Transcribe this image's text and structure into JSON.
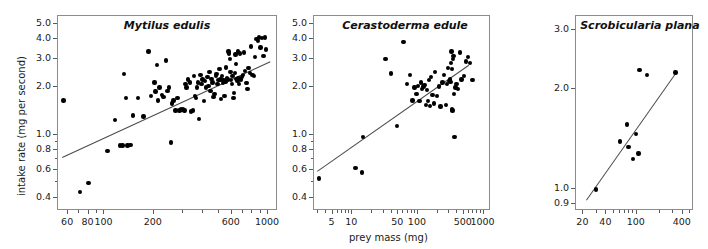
{
  "figure": {
    "y_axis_label": "intake rate (mg per second)",
    "x_axis_label": "prey mass (mg)",
    "scale": "log-log",
    "marker_color": "#000000",
    "line_color": "#4a4a4a",
    "frame_color": "#8c8c8c"
  },
  "chart_data": [
    {
      "type": "scatter",
      "title": "Mytilus edulis",
      "xlabel": "prey mass (mg)",
      "ylabel": "intake rate (mg per second)",
      "xscale": "log",
      "yscale": "log",
      "xlim": [
        52,
        1150
      ],
      "ylim": [
        0.33,
        5.6
      ],
      "xticks": [
        60,
        80,
        100,
        200,
        600,
        1000
      ],
      "xtick_labels": [
        "60",
        "80",
        "100",
        "200",
        "600",
        "1000"
      ],
      "yticks": [
        0.4,
        0.6,
        0.8,
        1.0,
        2.0,
        3.0,
        4.0,
        5.0
      ],
      "ytick_labels": [
        "0.4",
        "0.6",
        "0.8",
        "1.0",
        "2.0",
        "3.0",
        "4.0",
        "5.0"
      ],
      "grid": false,
      "legend": "none",
      "fit_line": {
        "x": [
          56,
          1050
        ],
        "y": [
          0.71,
          2.85
        ]
      },
      "points": [
        [
          57,
          1.62
        ],
        [
          72,
          0.43
        ],
        [
          81,
          0.49
        ],
        [
          106,
          0.78
        ],
        [
          118,
          1.22
        ],
        [
          126,
          0.84
        ],
        [
          131,
          0.84
        ],
        [
          134,
          2.38
        ],
        [
          137,
          1.68
        ],
        [
          140,
          0.84
        ],
        [
          146,
          0.85
        ],
        [
          152,
          1.3
        ],
        [
          163,
          1.68
        ],
        [
          176,
          1.28
        ],
        [
          188,
          3.3
        ],
        [
          196,
          1.73
        ],
        [
          205,
          2.1
        ],
        [
          208,
          1.84
        ],
        [
          212,
          2.7
        ],
        [
          216,
          1.62
        ],
        [
          220,
          1.95
        ],
        [
          228,
          1.75
        ],
        [
          233,
          1.7
        ],
        [
          241,
          2.9
        ],
        [
          246,
          1.85
        ],
        [
          252,
          1.95
        ],
        [
          258,
          0.88
        ],
        [
          263,
          1.55
        ],
        [
          268,
          1.62
        ],
        [
          276,
          1.4
        ],
        [
          284,
          1.68
        ],
        [
          292,
          1.4
        ],
        [
          298,
          1.42
        ],
        [
          305,
          1.42
        ],
        [
          312,
          1.4
        ],
        [
          318,
          2.05
        ],
        [
          322,
          1.95
        ],
        [
          330,
          2.2
        ],
        [
          337,
          2.1
        ],
        [
          344,
          1.38
        ],
        [
          352,
          1.4
        ],
        [
          358,
          2.3
        ],
        [
          362,
          1.72
        ],
        [
          368,
          1.68
        ],
        [
          372,
          1.95
        ],
        [
          378,
          2.1
        ],
        [
          385,
          1.24
        ],
        [
          392,
          2.35
        ],
        [
          398,
          2.05
        ],
        [
          404,
          2.2
        ],
        [
          412,
          1.6
        ],
        [
          418,
          2.15
        ],
        [
          424,
          1.95
        ],
        [
          432,
          2.28
        ],
        [
          438,
          2.0
        ],
        [
          444,
          2.45
        ],
        [
          452,
          1.85
        ],
        [
          458,
          2.22
        ],
        [
          464,
          2.1
        ],
        [
          470,
          1.7
        ],
        [
          478,
          1.78
        ],
        [
          486,
          2.3
        ],
        [
          492,
          2.38
        ],
        [
          498,
          2.05
        ],
        [
          504,
          2.18
        ],
        [
          512,
          2.55
        ],
        [
          518,
          2.2
        ],
        [
          524,
          1.65
        ],
        [
          530,
          2.3
        ],
        [
          536,
          2.08
        ],
        [
          542,
          2.18
        ],
        [
          548,
          1.72
        ],
        [
          556,
          2.12
        ],
        [
          562,
          2.62
        ],
        [
          568,
          2.25
        ],
        [
          574,
          2.2
        ],
        [
          580,
          3.3
        ],
        [
          586,
          3.2
        ],
        [
          592,
          2.95
        ],
        [
          598,
          2.45
        ],
        [
          604,
          2.18
        ],
        [
          610,
          2.05
        ],
        [
          616,
          2.3
        ],
        [
          622,
          1.68
        ],
        [
          628,
          1.8
        ],
        [
          634,
          2.42
        ],
        [
          640,
          3.15
        ],
        [
          646,
          2.75
        ],
        [
          652,
          2.22
        ],
        [
          658,
          2.15
        ],
        [
          664,
          3.3
        ],
        [
          670,
          2.25
        ],
        [
          676,
          2.05
        ],
        [
          684,
          3.2
        ],
        [
          692,
          2.2
        ],
        [
          700,
          2.28
        ],
        [
          712,
          2.35
        ],
        [
          722,
          3.25
        ],
        [
          734,
          2.48
        ],
        [
          748,
          2.08
        ],
        [
          760,
          1.92
        ],
        [
          772,
          2.6
        ],
        [
          786,
          2.42
        ],
        [
          800,
          3.55
        ],
        [
          815,
          2.35
        ],
        [
          830,
          2.3
        ],
        [
          845,
          3.05
        ],
        [
          862,
          3.95
        ],
        [
          878,
          3.85
        ],
        [
          895,
          4.05
        ],
        [
          910,
          3.5
        ],
        [
          930,
          4.0
        ],
        [
          952,
          3.1
        ],
        [
          968,
          4.05
        ],
        [
          985,
          3.4
        ]
      ]
    },
    {
      "type": "scatter",
      "title": "Cerastoderma edule",
      "xlabel": "prey mass (mg)",
      "ylabel": "intake rate (mg per second)",
      "xscale": "log",
      "yscale": "log",
      "xlim": [
        2.6,
        1300
      ],
      "ylim": [
        0.33,
        5.6
      ],
      "xticks": [
        5,
        10,
        50,
        100,
        500,
        1000
      ],
      "xtick_labels": [
        "5",
        "10",
        "50",
        "100",
        "500",
        "1000"
      ],
      "yticks": [
        0.4,
        0.6,
        0.8,
        1.0,
        2.0,
        3.0,
        4.0,
        5.0
      ],
      "ytick_labels": [
        "0.4",
        "0.6",
        "0.8",
        "1.0",
        "2.0",
        "3.0",
        "4.0",
        "5.0"
      ],
      "grid": false,
      "legend": "none",
      "fit_line": {
        "x": [
          3.0,
          620
        ],
        "y": [
          0.58,
          2.72
        ]
      },
      "points": [
        [
          3.2,
          0.52
        ],
        [
          11.5,
          0.61
        ],
        [
          14.5,
          0.57
        ],
        [
          15.0,
          0.95
        ],
        [
          33,
          2.95
        ],
        [
          40,
          2.4
        ],
        [
          50,
          1.12
        ],
        [
          62,
          3.8
        ],
        [
          70,
          2.05
        ],
        [
          78,
          2.35
        ],
        [
          85,
          1.62
        ],
        [
          92,
          1.95
        ],
        [
          98,
          1.78
        ],
        [
          104,
          2.0
        ],
        [
          110,
          1.6
        ],
        [
          116,
          2.1
        ],
        [
          120,
          1.92
        ],
        [
          125,
          1.98
        ],
        [
          130,
          2.02
        ],
        [
          136,
          1.52
        ],
        [
          142,
          1.88
        ],
        [
          148,
          1.6
        ],
        [
          152,
          2.18
        ],
        [
          158,
          1.5
        ],
        [
          165,
          2.28
        ],
        [
          172,
          1.75
        ],
        [
          180,
          1.55
        ],
        [
          190,
          2.45
        ],
        [
          200,
          1.72
        ],
        [
          215,
          1.98
        ],
        [
          230,
          1.48
        ],
        [
          245,
          2.1
        ],
        [
          260,
          2.35
        ],
        [
          275,
          1.52
        ],
        [
          290,
          2.05
        ],
        [
          300,
          2.6
        ],
        [
          310,
          2.15
        ],
        [
          318,
          2.2
        ],
        [
          322,
          2.18
        ],
        [
          326,
          2.12
        ],
        [
          330,
          2.8
        ],
        [
          335,
          3.3
        ],
        [
          340,
          2.55
        ],
        [
          345,
          1.42
        ],
        [
          350,
          1.4
        ],
        [
          355,
          2.95
        ],
        [
          362,
          3.1
        ],
        [
          368,
          1.78
        ],
        [
          375,
          0.95
        ],
        [
          385,
          1.95
        ],
        [
          400,
          2.05
        ],
        [
          420,
          1.92
        ],
        [
          450,
          3.25
        ],
        [
          480,
          2.2
        ],
        [
          520,
          2.32
        ],
        [
          560,
          2.85
        ],
        [
          600,
          3.05
        ],
        [
          640,
          2.78
        ],
        [
          700,
          2.18
        ]
      ]
    },
    {
      "type": "scatter",
      "title": "Scrobicularia plana",
      "xlabel": "prey mass (mg)",
      "ylabel": "intake rate (mg per second)",
      "xscale": "log",
      "yscale": "log",
      "xlim": [
        16,
        560
      ],
      "ylim": [
        0.86,
        3.3
      ],
      "xticks": [
        20,
        40,
        100,
        400
      ],
      "xtick_labels": [
        "20",
        "40",
        "100",
        "400"
      ],
      "yticks": [
        0.9,
        1.0,
        2.0,
        3.0
      ],
      "ytick_labels": [
        "0.9",
        "1.0",
        "2.0",
        "3.0"
      ],
      "grid": false,
      "legend": "none",
      "fit_line": {
        "x": [
          22,
          330
        ],
        "y": [
          0.92,
          2.22
        ]
      },
      "points": [
        [
          30,
          0.99
        ],
        [
          62,
          1.38
        ],
        [
          76,
          1.55
        ],
        [
          80,
          1.33
        ],
        [
          92,
          1.22
        ],
        [
          100,
          1.45
        ],
        [
          108,
          1.27
        ],
        [
          112,
          2.26
        ],
        [
          140,
          2.18
        ],
        [
          330,
          2.22
        ]
      ]
    }
  ]
}
